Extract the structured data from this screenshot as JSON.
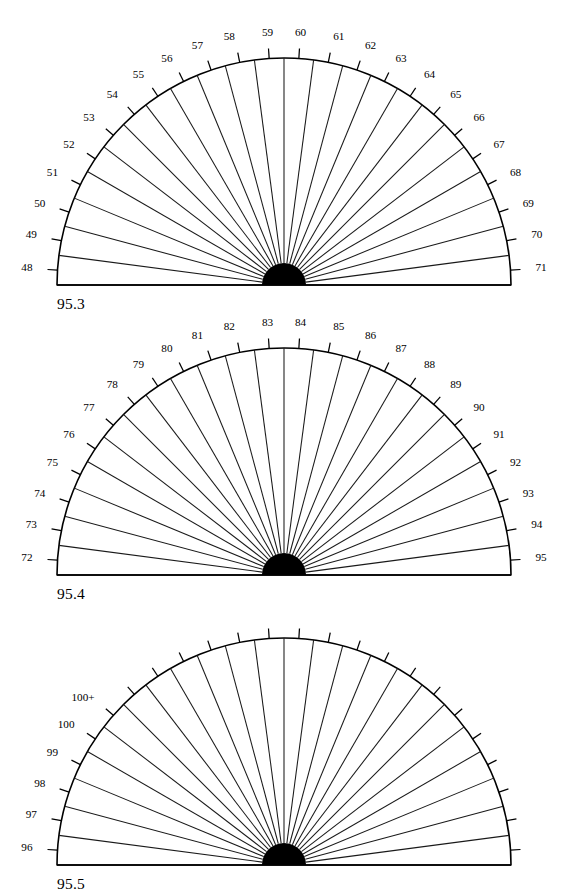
{
  "figure": {
    "title": "",
    "background_color": "#ffffff",
    "line_color": "#000000",
    "hub_color": "#000000",
    "width": 567,
    "height": 885
  },
  "chart_data": [
    {
      "type": "pie",
      "title": "95.3",
      "subtitle": "",
      "xlabel": "",
      "ylabel": "",
      "orientation": "semicircle-up",
      "sector_count": 24,
      "sectors_labeled": 24,
      "categories": [
        "48",
        "49",
        "50",
        "51",
        "52",
        "53",
        "54",
        "55",
        "56",
        "57",
        "58",
        "59",
        "60",
        "61",
        "62",
        "63",
        "64",
        "65",
        "66",
        "67",
        "68",
        "69",
        "70",
        "71"
      ],
      "values": [
        1,
        1,
        1,
        1,
        1,
        1,
        1,
        1,
        1,
        1,
        1,
        1,
        1,
        1,
        1,
        1,
        1,
        1,
        1,
        1,
        1,
        1,
        1,
        1
      ],
      "legend": "none",
      "grid": false,
      "center_x": 284,
      "baseline_y": 285,
      "radius": 227,
      "hub_radius": 22,
      "tick_length": 10,
      "label_offset": 15
    },
    {
      "type": "pie",
      "title": "95.4",
      "subtitle": "",
      "xlabel": "",
      "ylabel": "",
      "orientation": "semicircle-up",
      "sector_count": 24,
      "sectors_labeled": 24,
      "categories": [
        "72",
        "73",
        "74",
        "75",
        "76",
        "77",
        "78",
        "79",
        "80",
        "81",
        "82",
        "83",
        "84",
        "85",
        "86",
        "87",
        "88",
        "89",
        "90",
        "91",
        "92",
        "93",
        "94",
        "95"
      ],
      "values": [
        1,
        1,
        1,
        1,
        1,
        1,
        1,
        1,
        1,
        1,
        1,
        1,
        1,
        1,
        1,
        1,
        1,
        1,
        1,
        1,
        1,
        1,
        1,
        1
      ],
      "legend": "none",
      "grid": false,
      "center_x": 284,
      "baseline_y": 575,
      "radius": 227,
      "hub_radius": 22,
      "tick_length": 10,
      "label_offset": 15
    },
    {
      "type": "pie",
      "title": "95.5",
      "subtitle": "",
      "xlabel": "",
      "ylabel": "",
      "orientation": "semicircle-up",
      "sector_count": 24,
      "sectors_labeled": 6,
      "categories": [
        "96",
        "97",
        "98",
        "99",
        "100",
        "100+",
        "",
        "",
        "",
        "",
        "",
        "",
        "",
        "",
        "",
        "",
        "",
        "",
        "",
        "",
        "",
        "",
        "",
        ""
      ],
      "values": [
        1,
        1,
        1,
        1,
        1,
        1,
        1,
        1,
        1,
        1,
        1,
        1,
        1,
        1,
        1,
        1,
        1,
        1,
        1,
        1,
        1,
        1,
        1,
        1
      ],
      "legend": "none",
      "grid": false,
      "center_x": 284,
      "baseline_y": 865,
      "radius": 227,
      "hub_radius": 22,
      "tick_length": 10,
      "label_offset": 15
    }
  ],
  "captions": [
    {
      "text": "95.3",
      "x": 57,
      "y": 295
    },
    {
      "text": "95.4",
      "x": 57,
      "y": 585
    },
    {
      "text": "95.5",
      "x": 57,
      "y": 875
    }
  ]
}
